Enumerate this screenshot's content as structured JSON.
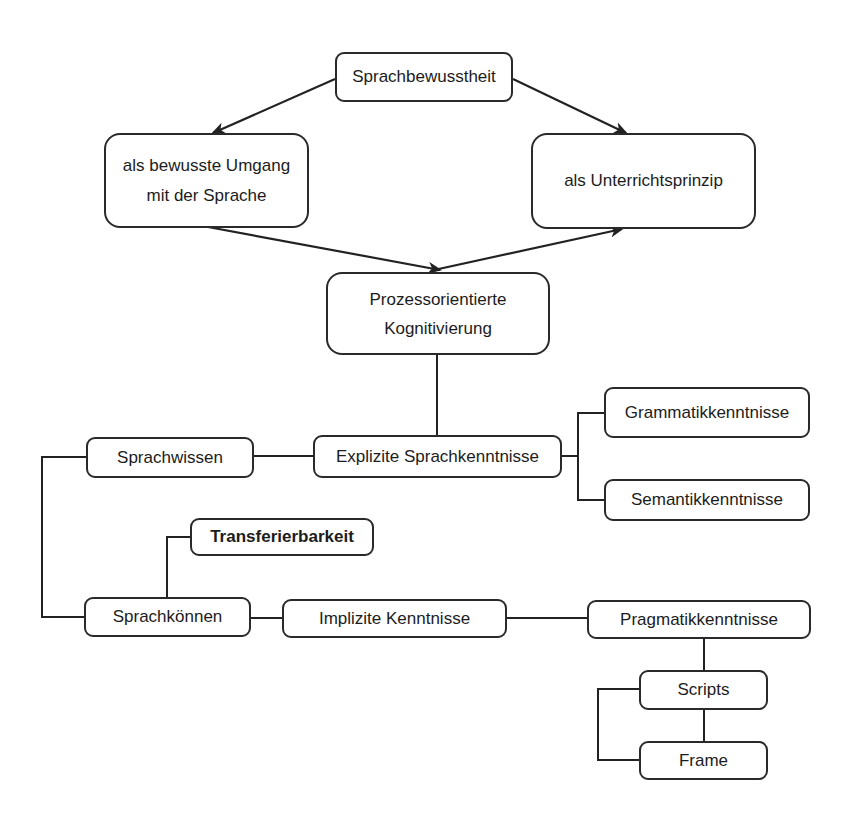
{
  "diagram": {
    "type": "concept-map",
    "nodes": {
      "sprachbewusstheit": {
        "label": "Sprachbewusstheit"
      },
      "bewusster_umgang": {
        "line1": "als bewusste Umgang",
        "line2": "mit der Sprache"
      },
      "unterrichtsprinzip": {
        "label": "als Unterrichtsprinzip"
      },
      "kognitivierung": {
        "line1": "Prozessorientierte",
        "line2": "Kognitivierung"
      },
      "explizite": {
        "label": "Explizite Sprachkenntnisse"
      },
      "sprachwissen": {
        "label": "Sprachwissen"
      },
      "grammatik": {
        "label": "Grammatikkenntnisse"
      },
      "semantik": {
        "label": "Semantikkenntnisse"
      },
      "transferierbarkeit": {
        "label": "Transferierbarkeit"
      },
      "sprachkoennen": {
        "label": "Sprachkönnen"
      },
      "implizite": {
        "label": "Implizite Kenntnisse"
      },
      "pragmatik": {
        "label": "Pragmatikkenntnisse"
      },
      "scripts": {
        "label": "Scripts"
      },
      "frame": {
        "label": "Frame"
      }
    },
    "edges": [
      {
        "from": "Sprachbewusstheit",
        "to": "als bewusste Umgang mit der Sprache",
        "style": "arrow"
      },
      {
        "from": "Sprachbewusstheit",
        "to": "als Unterrichtsprinzip",
        "style": "arrow"
      },
      {
        "from": "als bewusste Umgang mit der Sprache",
        "to": "Prozessorientierte Kognitivierung",
        "style": "arrow"
      },
      {
        "from": "Prozessorientierte Kognitivierung",
        "to": "als Unterrichtsprinzip",
        "style": "arrow"
      },
      {
        "from": "Prozessorientierte Kognitivierung",
        "to": "Explizite Sprachkenntnisse",
        "style": "line"
      },
      {
        "from": "Explizite Sprachkenntnisse",
        "to": "Sprachwissen",
        "style": "line"
      },
      {
        "from": "Explizite Sprachkenntnisse",
        "to": "Grammatikkenntnisse",
        "style": "line"
      },
      {
        "from": "Explizite Sprachkenntnisse",
        "to": "Semantikkenntnisse",
        "style": "line"
      },
      {
        "from": "Sprachwissen",
        "to": "Sprachkönnen",
        "style": "line"
      },
      {
        "from": "Sprachkönnen",
        "to": "Transferierbarkeit",
        "style": "line"
      },
      {
        "from": "Sprachkönnen",
        "to": "Implizite Kenntnisse",
        "style": "line"
      },
      {
        "from": "Implizite Kenntnisse",
        "to": "Pragmatikkenntnisse",
        "style": "line"
      },
      {
        "from": "Pragmatikkenntnisse",
        "to": "Scripts",
        "style": "line"
      },
      {
        "from": "Scripts",
        "to": "Frame",
        "style": "line"
      }
    ],
    "colors": {
      "stroke": "#2a2a2a",
      "text": "#1c1c1c",
      "background": "#ffffff"
    }
  }
}
